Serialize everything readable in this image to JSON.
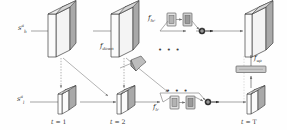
{
  "figure": {
    "type": "architecture-diagram",
    "background_color": "#fefefe",
    "line_color": "#6e6e6e",
    "slab_face_color": "#a9a9a9",
    "slab_edge_color": "#3f3f3f",
    "box_fill_color": "#c9c9c9"
  },
  "inputs": {
    "hr_stream": {
      "base": "s",
      "sup": "a",
      "sub": "h"
    },
    "lr_stream": {
      "base": "s",
      "sup": "a",
      "sub": "l"
    }
  },
  "functions": {
    "f_hr": {
      "base": "f",
      "sub": "hr"
    },
    "f_lr": {
      "base": "f",
      "sub": "lr"
    },
    "f_down": {
      "base": "f",
      "sub": "down"
    },
    "f_up": {
      "base": "f",
      "sub": "up"
    }
  },
  "time_steps": [
    {
      "id": "t1",
      "label_base": "t",
      "label_eq": "= 1"
    },
    {
      "id": "t2",
      "label_base": "t",
      "label_eq": "= 2"
    },
    {
      "id": "tT",
      "label_base": "t",
      "label_eq": "= T"
    }
  ],
  "ellipses": [
    {
      "id": "top-ellipsis",
      "text": "• • •"
    },
    {
      "id": "bottom-ellipsis",
      "text": "• • •"
    }
  ],
  "nodes": {
    "hr_slabs": [
      {
        "id": "hr-slab-1",
        "step": "t = 1"
      },
      {
        "id": "hr-slab-2",
        "step": "t = 2"
      },
      {
        "id": "hr-slab-T",
        "step": "t = T"
      }
    ],
    "lr_cubes": [
      {
        "id": "lr-cube-1",
        "step": "t = 1"
      },
      {
        "id": "lr-cube-2",
        "step": "t = 2"
      },
      {
        "id": "lr-cube-T",
        "step": "t = T"
      }
    ],
    "hr_res_blocks": [
      {
        "id": "hr-block-a"
      },
      {
        "id": "hr-block-b"
      }
    ],
    "lr_res_blocks": [
      {
        "id": "lr-block-a"
      },
      {
        "id": "lr-block-b"
      }
    ],
    "upsample_block": {
      "id": "upsample-bar"
    },
    "sum_nodes": [
      {
        "id": "sum-node-top"
      },
      {
        "id": "sum-node-bottom"
      }
    ]
  }
}
